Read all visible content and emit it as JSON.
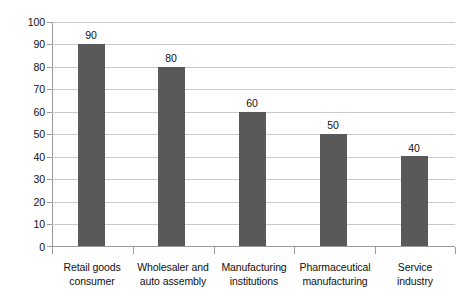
{
  "chart_data": {
    "type": "bar",
    "title": "",
    "subtitle": "",
    "xlabel": "",
    "ylabel": "",
    "ylim": [
      0,
      100
    ],
    "ytick_step": 10,
    "yticks": [
      0,
      10,
      20,
      30,
      40,
      50,
      60,
      70,
      80,
      90,
      100
    ],
    "ytick_labels": [
      "0",
      "10",
      "20",
      "30",
      "40",
      "50",
      "60",
      "70",
      "80",
      "90",
      "100"
    ],
    "categories": [
      "Retail goods consumer",
      "Wholesaler and auto assembly",
      "Manufacturing institutions",
      "Pharmaceutical manufacturing",
      "Service industry"
    ],
    "category_lines": [
      [
        "Retail goods",
        "consumer"
      ],
      [
        "Wholesaler and",
        "auto assembly"
      ],
      [
        "Manufacturing",
        "institutions"
      ],
      [
        "Pharmaceutical",
        "manufacturing"
      ],
      [
        "Service",
        "industry"
      ]
    ],
    "values": [
      90,
      80,
      60,
      50,
      40
    ],
    "value_labels": [
      "90",
      "80",
      "60",
      "50",
      "40"
    ],
    "legend": [],
    "legend_position": "none",
    "grid": {
      "horizontal": true,
      "vertical": false
    },
    "colors": {
      "bar": "#595959",
      "gridline": "#c9c9c9",
      "axis": "#9a9a9a",
      "text": "#111111",
      "background": "#ffffff"
    }
  }
}
